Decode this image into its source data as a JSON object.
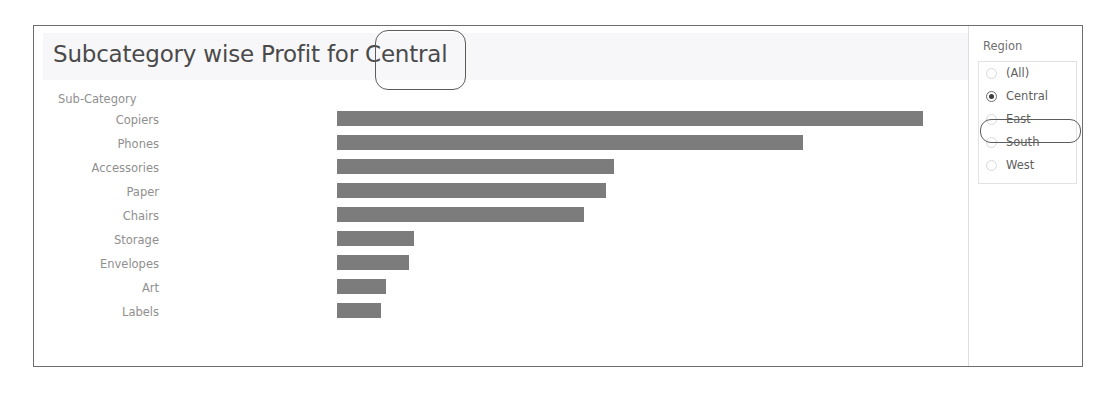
{
  "chart": {
    "title": "Subcategory wise Profit for Central",
    "axis_header": "Sub-Category"
  },
  "filter": {
    "title": "Region",
    "options": [
      {
        "label": "(All)",
        "selected": false
      },
      {
        "label": "Central",
        "selected": true
      },
      {
        "label": "East",
        "selected": false
      },
      {
        "label": "South",
        "selected": false
      },
      {
        "label": "West",
        "selected": false
      }
    ]
  },
  "annotations": {
    "title_highlight": "Central",
    "filter_highlight": "Central"
  },
  "colors": {
    "bar": "#7c7c7c",
    "title_band": "#f7f7f9",
    "label_text": "#8f8f8f",
    "frame": "#6e6e6e",
    "annotation": "#5c5c5c"
  },
  "chart_data": {
    "type": "bar",
    "orientation": "horizontal",
    "title": "Subcategory wise Profit for Central",
    "xlabel": "",
    "ylabel": "Sub-Category",
    "categories": [
      "Copiers",
      "Phones",
      "Accessories",
      "Paper",
      "Chairs",
      "Storage",
      "Envelopes",
      "Art",
      "Labels"
    ],
    "values": [
      586,
      466,
      277,
      269,
      247,
      77,
      72,
      49,
      44
    ],
    "xlim": [
      0,
      600
    ],
    "grid": false,
    "legend": false,
    "note": "Values are profit magnitudes read from bar lengths; axis is unlabeled in the view."
  }
}
